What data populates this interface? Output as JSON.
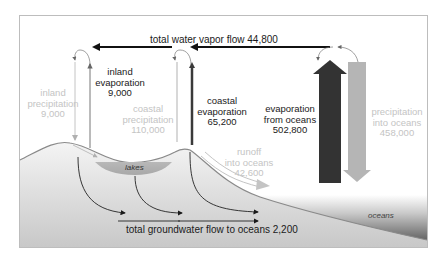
{
  "diagram": {
    "labels": {
      "vapor_flow": "total water vapor flow 44,800",
      "inland_precipitation": [
        "inland",
        "precipitation",
        "9,000"
      ],
      "inland_evaporation": [
        "inland",
        "evaporation",
        "9,000"
      ],
      "coastal_precipitation": [
        "coastal",
        "precipitation",
        "110,000"
      ],
      "coastal_evaporation": [
        "coastal",
        "evaporation",
        "65,200"
      ],
      "evaporation_oceans": [
        "evaporation",
        "from oceans",
        "502,800"
      ],
      "precipitation_oceans": [
        "precipitation",
        "into oceans",
        "458,000"
      ],
      "runoff": [
        "runoff",
        "into oceans",
        "42,600"
      ],
      "lakes": "lakes",
      "oceans": "oceans",
      "groundwater": "total groundwater flow to oceans 2,200"
    },
    "flows": [
      {
        "name": "total water vapor flow",
        "value": 44800
      },
      {
        "name": "inland precipitation",
        "value": 9000
      },
      {
        "name": "inland evaporation",
        "value": 9000
      },
      {
        "name": "coastal precipitation",
        "value": 110000
      },
      {
        "name": "coastal evaporation",
        "value": 65200
      },
      {
        "name": "evaporation from oceans",
        "value": 502800
      },
      {
        "name": "precipitation into oceans",
        "value": 458000
      },
      {
        "name": "runoff into oceans",
        "value": 42600
      },
      {
        "name": "total groundwater flow to oceans",
        "value": 2200
      }
    ],
    "colors": {
      "dark": "#2a2a2a",
      "light": "#c4c4c4",
      "ocean_arrow_up": "#333333",
      "ocean_arrow_down": "#b3b3b3",
      "frame": "#bdbdbd"
    }
  }
}
